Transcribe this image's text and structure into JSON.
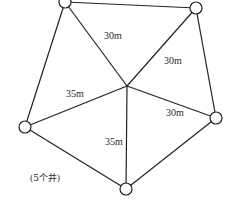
{
  "diagram": {
    "type": "well-layout",
    "center": {
      "x": 127,
      "y": 86
    },
    "wells": [
      {
        "id": "top-left",
        "x": 65,
        "y": 2
      },
      {
        "id": "top-right",
        "x": 196,
        "y": 8
      },
      {
        "id": "right",
        "x": 216,
        "y": 118
      },
      {
        "id": "bottom",
        "x": 126,
        "y": 189
      },
      {
        "id": "left",
        "x": 25,
        "y": 127
      }
    ],
    "well_radius": 6,
    "edge_color": "#222222",
    "labels": [
      {
        "text": "30m",
        "x": 113,
        "y": 36,
        "edge": "center-top-left"
      },
      {
        "text": "30m",
        "x": 173,
        "y": 61,
        "edge": "center-top-right"
      },
      {
        "text": "35m",
        "x": 75,
        "y": 94,
        "edge": "center-left"
      },
      {
        "text": "30m",
        "x": 175,
        "y": 113,
        "edge": "center-right"
      },
      {
        "text": "35m",
        "x": 114,
        "y": 142,
        "edge": "center-bottom"
      }
    ],
    "caption": {
      "text": "(5个井)",
      "x": 45,
      "y": 178
    }
  }
}
